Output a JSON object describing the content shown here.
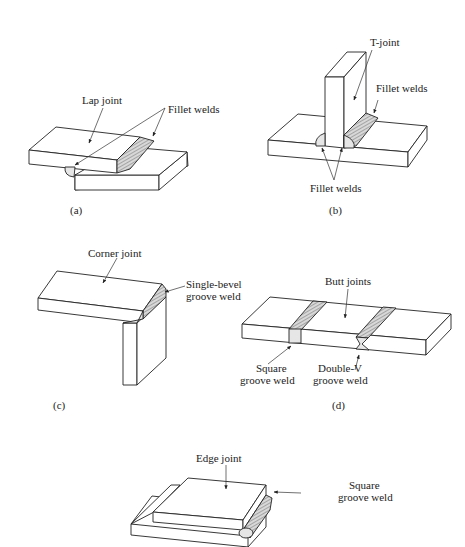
{
  "figure": {
    "panels": [
      {
        "id": "a",
        "caption": "(a)",
        "joint_label": "Lap joint",
        "weld_label": "Fillet welds"
      },
      {
        "id": "b",
        "caption": "(b)",
        "joint_label": "T-joint",
        "weld_label_top": "Fillet welds",
        "weld_label_bottom": "Fillet welds"
      },
      {
        "id": "c",
        "caption": "(c)",
        "joint_label": "Corner joint",
        "weld_label_line1": "Single-bevel",
        "weld_label_line2": "groove weld"
      },
      {
        "id": "d",
        "caption": "(d)",
        "joint_label": "Butt joints",
        "weld_left_line1": "Square",
        "weld_left_line2": "groove weld",
        "weld_right_line1": "Double-V",
        "weld_right_line2": "groove weld"
      },
      {
        "id": "e",
        "caption": "(e)",
        "joint_label": "Edge joint",
        "weld_label_line1": "Square",
        "weld_label_line2": "groove weld"
      }
    ]
  }
}
